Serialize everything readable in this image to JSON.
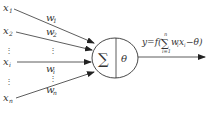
{
  "diagram": {
    "colors": {
      "line": "#333333",
      "text": "#333333",
      "background": "#ffffff"
    },
    "inputs": [
      {
        "var": "x",
        "sub": "1",
        "weight": "w",
        "weight_sub": "1"
      },
      {
        "var": "x",
        "sub": "2",
        "weight": "w",
        "weight_sub": "2"
      },
      {
        "var": "x",
        "sub": "i",
        "weight": "w",
        "weight_sub": "i"
      },
      {
        "var": "x",
        "sub": "n",
        "weight": "w",
        "weight_sub": "n"
      }
    ],
    "ellipsis": "⋮",
    "neuron": {
      "sum_symbol": "∑",
      "threshold_symbol": "θ"
    },
    "output": {
      "lhs": "y=f",
      "open": "(",
      "sum": "∑",
      "sum_upper": "n",
      "sum_lower": "i=1",
      "term_w": "w",
      "term_w_sub": "i",
      "term_x": "x",
      "term_x_sub": "i",
      "minus_theta": "−θ",
      "close": ")"
    }
  }
}
